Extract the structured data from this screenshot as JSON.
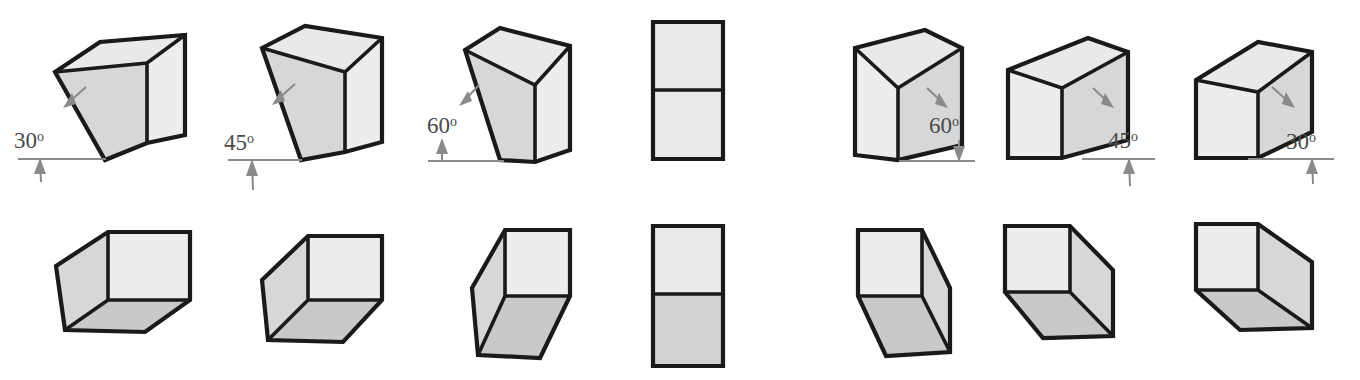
{
  "figure": {
    "rows": 2,
    "columns": 7,
    "background_color": "#ffffff"
  },
  "palette": {
    "edge_color": "#1a1a1a",
    "top_face": "#e9e9e9",
    "front_face": "#ededed",
    "side_face": "#d7d7d7",
    "bottom_face": "#c9c9c9",
    "annotation_color": "#8a8a8a",
    "label_text_color": "#4a4a4a"
  },
  "degree_symbol": "o",
  "top_row": {
    "label": "Boxes viewed from above",
    "items": [
      {
        "index": 1,
        "angle_value": "30",
        "angle_label": "30o",
        "facing": "left",
        "has_callout": true,
        "callout_side": "left",
        "visible_faces": [
          "top",
          "side",
          "front"
        ]
      },
      {
        "index": 2,
        "angle_value": "45",
        "angle_label": "45o",
        "facing": "left",
        "has_callout": true,
        "callout_side": "left",
        "visible_faces": [
          "top",
          "side",
          "front"
        ]
      },
      {
        "index": 3,
        "angle_value": "60",
        "angle_label": "60o",
        "facing": "left",
        "has_callout": true,
        "callout_side": "left",
        "visible_faces": [
          "top",
          "side",
          "front"
        ]
      },
      {
        "index": 4,
        "angle_value": "90",
        "angle_label": "",
        "facing": "front",
        "has_callout": false,
        "callout_side": "none",
        "visible_faces": [
          "top",
          "front"
        ]
      },
      {
        "index": 5,
        "angle_value": "60",
        "angle_label": "60o",
        "facing": "right",
        "has_callout": true,
        "callout_side": "right",
        "visible_faces": [
          "top",
          "front",
          "side"
        ]
      },
      {
        "index": 6,
        "angle_value": "45",
        "angle_label": "45o",
        "facing": "right",
        "has_callout": true,
        "callout_side": "right",
        "visible_faces": [
          "top",
          "front",
          "side"
        ]
      },
      {
        "index": 7,
        "angle_value": "30",
        "angle_label": "30o",
        "facing": "right",
        "has_callout": true,
        "callout_side": "right",
        "visible_faces": [
          "top",
          "front",
          "side"
        ]
      }
    ]
  },
  "bottom_row": {
    "label": "Boxes viewed from below",
    "items": [
      {
        "index": 1,
        "angle_value": "30",
        "facing": "left",
        "has_callout": false,
        "visible_faces": [
          "side",
          "front",
          "bottom"
        ]
      },
      {
        "index": 2,
        "angle_value": "45",
        "facing": "left",
        "has_callout": false,
        "visible_faces": [
          "side",
          "front",
          "bottom"
        ]
      },
      {
        "index": 3,
        "angle_value": "60",
        "facing": "left",
        "has_callout": false,
        "visible_faces": [
          "side",
          "front",
          "bottom"
        ]
      },
      {
        "index": 4,
        "angle_value": "90",
        "facing": "front",
        "has_callout": false,
        "visible_faces": [
          "front",
          "bottom"
        ]
      },
      {
        "index": 5,
        "angle_value": "60",
        "facing": "right",
        "has_callout": false,
        "visible_faces": [
          "front",
          "side",
          "bottom"
        ]
      },
      {
        "index": 6,
        "angle_value": "45",
        "facing": "right",
        "has_callout": false,
        "visible_faces": [
          "front",
          "side",
          "bottom"
        ]
      },
      {
        "index": 7,
        "angle_value": "30",
        "facing": "right",
        "has_callout": false,
        "visible_faces": [
          "front",
          "side",
          "bottom"
        ]
      }
    ]
  }
}
